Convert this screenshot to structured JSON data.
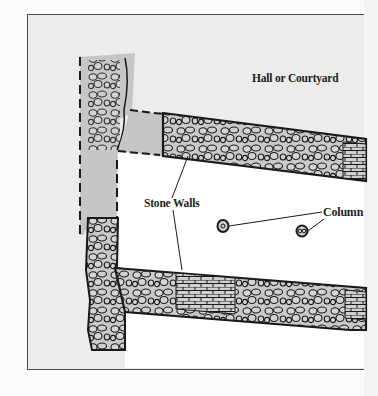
{
  "diagram": {
    "type": "architectural-floor-plan",
    "labels": {
      "hall": "Hall or Courtyard",
      "walls": "Stone Walls",
      "column": "Column"
    },
    "elements": {
      "walls": [
        {
          "id": "west-wall",
          "orientation": "vertical",
          "style": "rubble stone, partly dashed/gray (conjectural)"
        },
        {
          "id": "north-wall",
          "orientation": "horizontal",
          "style": "rubble stone with ashlar brick section at east end"
        },
        {
          "id": "south-wall",
          "orientation": "horizontal",
          "style": "rubble stone with ashlar brick sections"
        }
      ],
      "columns": [
        {
          "id": "column-1"
        },
        {
          "id": "column-2"
        }
      ]
    },
    "colors": {
      "background": "#ececea",
      "wall_fill": "#c8c8c6",
      "stone_outline": "#1a1a1a",
      "frame": "#4a4a4a",
      "floor": "#ffffff"
    }
  }
}
